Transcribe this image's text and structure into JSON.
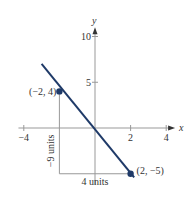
{
  "chart_data": {
    "type": "line",
    "title": "",
    "xlabel": "x",
    "ylabel": "y",
    "xlim": [
      -4.3,
      4.5
    ],
    "ylim": [
      -6.2,
      11
    ],
    "x_ticks": [
      -4,
      2,
      4
    ],
    "x_tick_labels": [
      "−4",
      "2",
      "4"
    ],
    "y_ticks": [
      5,
      10
    ],
    "y_tick_labels": [
      "5",
      "10"
    ],
    "grid": false,
    "series": [
      {
        "name": "line",
        "color": "#1f3a68",
        "x": [
          -3,
          2.2
        ],
        "y": [
          7,
          -5.4
        ]
      }
    ],
    "points": [
      {
        "x": -2,
        "y": 4,
        "label": "(−2, 4)"
      },
      {
        "x": 2,
        "y": -5,
        "label": "(2, −5)"
      }
    ],
    "annotations": {
      "rise_label": "−9 units",
      "run_label": "4 units"
    }
  }
}
